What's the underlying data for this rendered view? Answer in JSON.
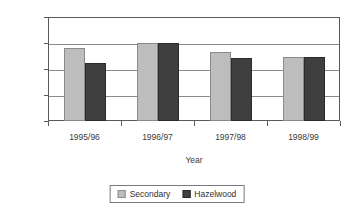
{
  "chart_data": {
    "type": "bar",
    "title": "",
    "subtitle": "",
    "xlabel": "Year",
    "ylabel": "Percentage",
    "categories": [
      "1995/96",
      "1996/97",
      "1997/98",
      "1998/99"
    ],
    "series": [
      {
        "name": "Secondary",
        "values": [
          34.1,
          35.0,
          33.2,
          32.3
        ],
        "color": "#bdbdbd"
      },
      {
        "name": "Hazelwood",
        "values": [
          31.1,
          35.0,
          32.2,
          32.3
        ],
        "color": "#3f3f3f"
      }
    ],
    "ylim": [
      20,
      40
    ],
    "yticks": [
      20,
      25,
      30,
      35,
      40
    ],
    "ytick_labels": [
      "20",
      "25",
      "30",
      "35",
      "40"
    ],
    "grid": true,
    "grid_axis": "y",
    "legend_position": "bottom",
    "plot_border": true
  },
  "axes": {
    "y_title": "Percentage",
    "x_title": "Year"
  },
  "legend": {
    "entries": [
      {
        "label": "Secondary"
      },
      {
        "label": "Hazelwood"
      }
    ]
  },
  "colors": {
    "series_secondary": "#bdbdbd",
    "series_hazelwood": "#3f3f3f",
    "axis": "#5a5a5a",
    "gridline": "#8c8c8c",
    "background": "#ffffff",
    "text": "#3a3a3a"
  }
}
